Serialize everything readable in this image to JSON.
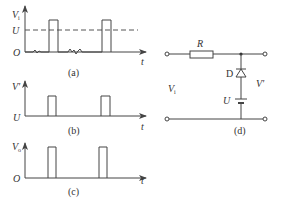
{
  "figure": {
    "panels": [
      {
        "id": "a",
        "caption": "(a)",
        "y_label": "V",
        "y_label_sub": "i",
        "origin_label": "O",
        "level_label": "U",
        "x_label": "t",
        "description": "Input voltage with noise near zero and two rectangular pulses exceeding threshold U (dashed)"
      },
      {
        "id": "b",
        "caption": "(b)",
        "y_label": "V'",
        "origin_label": "U",
        "x_label": "t",
        "description": "Output V' clipped at level U: flat at U with two rectangular pulses"
      },
      {
        "id": "c",
        "caption": "(c)",
        "y_label": "V",
        "y_label_sub": "o",
        "origin_label": "O",
        "x_label": "t",
        "description": "Output V_o: two clean rectangular pulses starting from zero"
      },
      {
        "id": "d",
        "caption": "(d)",
        "components": {
          "resistor": "R",
          "diode": "D",
          "battery": "U"
        },
        "input_label": "V",
        "input_label_sub": "i",
        "output_label": "V'",
        "description": "Diode clipping circuit: series resistor R, diode D in series with bias source U across output"
      }
    ]
  },
  "colors": {
    "line": "#444444",
    "text": "#333333",
    "background": "#ffffff"
  }
}
